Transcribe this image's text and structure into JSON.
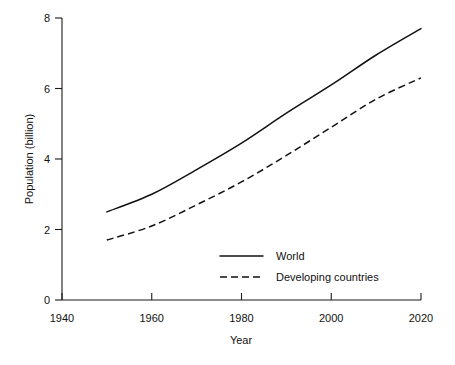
{
  "chart_data": {
    "type": "line",
    "title": "",
    "xlabel": "Year",
    "ylabel": "Population (billion)",
    "xlim": [
      1940,
      2020
    ],
    "ylim": [
      0,
      8
    ],
    "xticks": [
      1940,
      1960,
      1980,
      2000,
      2020
    ],
    "yticks": [
      0,
      2,
      4,
      6,
      8
    ],
    "grid": false,
    "legend_position": "inside-lower-center",
    "x": [
      1950,
      1960,
      1970,
      1980,
      1990,
      2000,
      2010,
      2020
    ],
    "series": [
      {
        "name": "World",
        "style": "solid",
        "color": "#111111",
        "values": [
          2.5,
          3.0,
          3.7,
          4.45,
          5.3,
          6.1,
          6.95,
          7.7
        ]
      },
      {
        "name": "Developing countries",
        "style": "dashed",
        "color": "#111111",
        "values": [
          1.7,
          2.1,
          2.7,
          3.35,
          4.1,
          4.9,
          5.7,
          6.3
        ]
      }
    ]
  },
  "axes": {
    "x_tick_labels": [
      "1940",
      "1960",
      "1980",
      "2000",
      "2020"
    ],
    "y_tick_labels": [
      "0",
      "2",
      "4",
      "6",
      "8"
    ],
    "x_axis_title": "Year",
    "y_axis_title": "Population (billion)"
  },
  "legend": {
    "entries": [
      {
        "label": "World",
        "style": "solid"
      },
      {
        "label": "Developing countries",
        "style": "dashed"
      }
    ]
  }
}
